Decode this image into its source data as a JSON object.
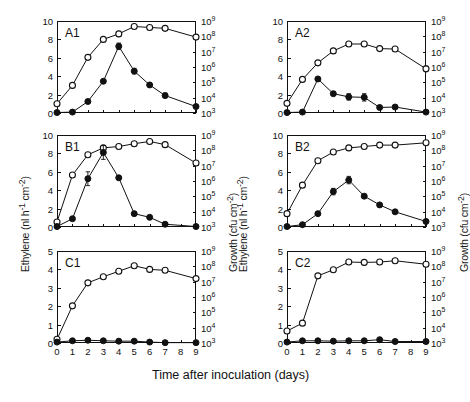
{
  "figure": {
    "xlabel": "Time after inoculation (days)",
    "ylabel_left": "Ethylene (nl h-1 cm-2)",
    "ylabel_right": "Growth (cfu cm-2)",
    "xticks": [
      "0",
      "1",
      "2",
      "3",
      "4",
      "5",
      "6",
      "7",
      "8",
      "9"
    ],
    "yticks_right": [
      "10",
      "10",
      "10",
      "10",
      "10",
      "10",
      "10"
    ],
    "yexp_right": [
      "3",
      "4",
      "5",
      "6",
      "7",
      "8",
      "9"
    ],
    "legend": {
      "open_circle": "Growth (cfu cm-2)",
      "filled_circle": "Ethylene (nl h-1 cm-2)"
    }
  },
  "chart_data": [
    {
      "type": "line",
      "title": "A1",
      "xlabel": "Time after inoculation (days)",
      "ylabel": "Ethylene (nl h-1 cm-2)",
      "ylabel_right": "Growth (cfu cm-2)",
      "xlim": [
        0,
        9
      ],
      "ylim": [
        0,
        10
      ],
      "ylim_right_log10": [
        3,
        9
      ],
      "yticks": [
        "0",
        "2",
        "4",
        "6",
        "8",
        "10"
      ],
      "grid": false,
      "x": [
        0,
        1,
        2,
        3,
        4,
        5,
        6,
        7,
        9
      ],
      "series": [
        {
          "name": "Growth (cfu cm-2)",
          "marker": "open-circle",
          "axis": "right",
          "values_left_scale": [
            1.0,
            3.0,
            6.05,
            8.0,
            8.6,
            9.4,
            9.3,
            9.2,
            8.25
          ],
          "errors": [
            0.0,
            0.15,
            0.18,
            0.12,
            0.12,
            0.1,
            0.1,
            0.1,
            0.12
          ]
        },
        {
          "name": "Ethylene (nl h-1 cm-2)",
          "marker": "filled-circle",
          "axis": "left",
          "values": [
            0.05,
            0.1,
            1.25,
            3.45,
            7.25,
            4.55,
            3.05,
            1.9,
            0.7
          ],
          "errors": [
            0.0,
            0.0,
            0.12,
            0.15,
            0.35,
            0.3,
            0.18,
            0.25,
            0.12
          ]
        }
      ]
    },
    {
      "type": "line",
      "title": "A2",
      "xlabel": "Time after inoculation (days)",
      "ylabel": "Ethylene (nl h-1 cm-2)",
      "ylabel_right": "Growth (cfu cm-2)",
      "xlim": [
        0,
        9
      ],
      "ylim": [
        0,
        10
      ],
      "ylim_right_log10": [
        3,
        9
      ],
      "yticks": [
        "0",
        "2",
        "4",
        "6",
        "8",
        "10"
      ],
      "grid": false,
      "x": [
        0,
        1,
        2,
        3,
        4,
        5,
        6,
        7,
        9
      ],
      "series": [
        {
          "name": "Growth (cfu cm-2)",
          "marker": "open-circle",
          "axis": "right",
          "values_left_scale": [
            1.05,
            3.65,
            5.45,
            6.75,
            7.5,
            7.5,
            7.0,
            6.95,
            4.8
          ],
          "errors": [
            0.0,
            0.15,
            0.15,
            0.15,
            0.2,
            0.15,
            0.15,
            0.15,
            0.3
          ]
        },
        {
          "name": "Ethylene (nl h-1 cm-2)",
          "marker": "filled-circle",
          "axis": "left",
          "values": [
            0.05,
            0.1,
            3.7,
            2.1,
            1.75,
            1.7,
            0.6,
            0.65,
            0.1
          ],
          "errors": [
            0.0,
            0.0,
            0.15,
            0.2,
            0.35,
            0.4,
            0.12,
            0.15,
            0.0
          ]
        }
      ]
    },
    {
      "type": "line",
      "title": "B1",
      "xlabel": "Time after inoculation (days)",
      "ylabel": "Ethylene (nl h-1 cm-2)",
      "ylabel_right": "Growth (cfu cm-2)",
      "xlim": [
        0,
        9
      ],
      "ylim": [
        0,
        10
      ],
      "ylim_right_log10": [
        3,
        9
      ],
      "yticks": [
        "0",
        "2",
        "4",
        "6",
        "8",
        "10"
      ],
      "grid": false,
      "x": [
        0,
        1,
        2,
        3,
        4,
        5,
        6,
        7,
        9
      ],
      "series": [
        {
          "name": "Growth (cfu cm-2)",
          "marker": "open-circle",
          "axis": "right",
          "values_left_scale": [
            0.55,
            5.65,
            7.85,
            8.6,
            8.75,
            9.05,
            9.3,
            8.95,
            6.95
          ],
          "errors": [
            0.0,
            0.15,
            0.12,
            0.12,
            0.12,
            0.12,
            0.1,
            0.12,
            0.2
          ]
        },
        {
          "name": "Ethylene (nl h-1 cm-2)",
          "marker": "filled-circle",
          "axis": "left",
          "values": [
            0.05,
            0.9,
            5.25,
            8.1,
            5.35,
            1.45,
            1.05,
            0.3,
            0.05
          ],
          "errors": [
            0.0,
            0.12,
            0.75,
            0.75,
            0.2,
            0.15,
            0.15,
            0.1,
            0.0
          ]
        }
      ]
    },
    {
      "type": "line",
      "title": "B2",
      "xlabel": "Time after inoculation (days)",
      "ylabel": "Ethylene (nl h-1 cm-2)",
      "ylabel_right": "Growth (cfu cm-2)",
      "xlim": [
        0,
        9
      ],
      "ylim": [
        0,
        10
      ],
      "ylim_right_log10": [
        3,
        9
      ],
      "yticks": [
        "0",
        "2",
        "4",
        "6",
        "8",
        "10"
      ],
      "grid": false,
      "x": [
        0,
        1,
        2,
        3,
        4,
        5,
        6,
        7,
        9
      ],
      "series": [
        {
          "name": "Growth (cfu cm-2)",
          "marker": "open-circle",
          "axis": "right",
          "values_left_scale": [
            1.45,
            4.55,
            7.2,
            8.15,
            8.6,
            8.75,
            8.9,
            8.9,
            9.15
          ],
          "errors": [
            0.0,
            0.15,
            0.12,
            0.12,
            0.25,
            0.12,
            0.12,
            0.1,
            0.12
          ]
        },
        {
          "name": "Ethylene (nl h-1 cm-2)",
          "marker": "filled-circle",
          "axis": "left",
          "values": [
            0.05,
            0.25,
            1.45,
            3.85,
            5.1,
            3.35,
            2.4,
            1.65,
            0.6
          ],
          "errors": [
            0.0,
            0.0,
            0.15,
            0.35,
            0.4,
            0.2,
            0.2,
            0.15,
            0.15
          ]
        }
      ]
    },
    {
      "type": "line",
      "title": "C1",
      "xlabel": "Time after inoculation (days)",
      "ylabel": "Ethylene (nl h-1 cm-2)",
      "ylabel_right": "Growth (cfu cm-2)",
      "xlim": [
        0,
        9
      ],
      "ylim": [
        0,
        5
      ],
      "ylim_right_log10": [
        3,
        9
      ],
      "yticks": [
        "0",
        "1",
        "2",
        "3",
        "4",
        "5"
      ],
      "grid": false,
      "x": [
        0,
        1,
        2,
        3,
        4,
        5,
        6,
        7,
        9
      ],
      "series": [
        {
          "name": "Growth (cfu cm-2)",
          "marker": "open-circle",
          "axis": "right",
          "values_left_scale": [
            0.2,
            2.02,
            3.27,
            3.6,
            3.9,
            4.2,
            4.0,
            3.95,
            3.5
          ],
          "errors": [
            0.0,
            0.08,
            0.08,
            0.08,
            0.08,
            0.08,
            0.08,
            0.08,
            0.1
          ]
        },
        {
          "name": "Ethylene (nl h-1 cm-2)",
          "marker": "filled-circle",
          "axis": "left",
          "values": [
            0.05,
            0.12,
            0.15,
            0.12,
            0.1,
            0.1,
            0.05,
            0.02,
            0.02
          ],
          "errors": [
            0.0,
            0.0,
            0.0,
            0.0,
            0.0,
            0.0,
            0.0,
            0.0,
            0.0
          ]
        }
      ]
    },
    {
      "type": "line",
      "title": "C2",
      "xlabel": "Time after inoculation (days)",
      "ylabel": "Ethylene (nl h-1 cm-2)",
      "ylabel_right": "Growth (cfu cm-2)",
      "xlim": [
        0,
        9
      ],
      "ylim": [
        0,
        5
      ],
      "ylim_right_log10": [
        3,
        9
      ],
      "yticks": [
        "0",
        "1",
        "2",
        "3",
        "4",
        "5"
      ],
      "grid": false,
      "x": [
        0,
        1,
        2,
        3,
        4,
        5,
        6,
        7,
        9
      ],
      "series": [
        {
          "name": "Growth (cfu cm-2)",
          "marker": "open-circle",
          "axis": "right",
          "values_left_scale": [
            0.65,
            1.08,
            3.65,
            3.98,
            4.4,
            4.38,
            4.4,
            4.47,
            4.28
          ],
          "errors": [
            0.0,
            0.08,
            0.08,
            0.08,
            0.08,
            0.08,
            0.08,
            0.08,
            0.08
          ]
        },
        {
          "name": "Ethylene (nl h-1 cm-2)",
          "marker": "filled-circle",
          "axis": "left",
          "values": [
            0.05,
            0.12,
            0.12,
            0.1,
            0.12,
            0.12,
            0.18,
            0.08,
            0.08
          ],
          "errors": [
            0.0,
            0.0,
            0.0,
            0.0,
            0.0,
            0.0,
            0.0,
            0.0,
            0.0
          ]
        }
      ]
    }
  ]
}
